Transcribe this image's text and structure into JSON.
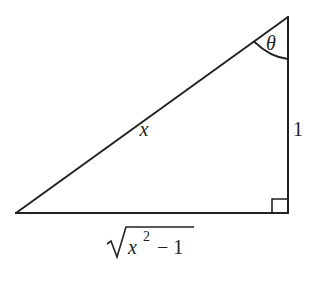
{
  "diagram": {
    "type": "right-triangle",
    "stroke_color": "#222222",
    "background_color": "#ffffff",
    "vertices": {
      "left": {
        "x": 16,
        "y": 213
      },
      "right_angle": {
        "x": 288,
        "y": 213
      },
      "top": {
        "x": 288,
        "y": 17
      }
    },
    "labels": {
      "hypotenuse": "x",
      "vertical_side": "1",
      "base_radicand_var": "x",
      "base_exponent": "2",
      "base_minus_one": "− 1",
      "angle": "θ"
    },
    "annotations": {
      "angle_at": "top",
      "right_angle_marker_at": "right_angle"
    }
  }
}
